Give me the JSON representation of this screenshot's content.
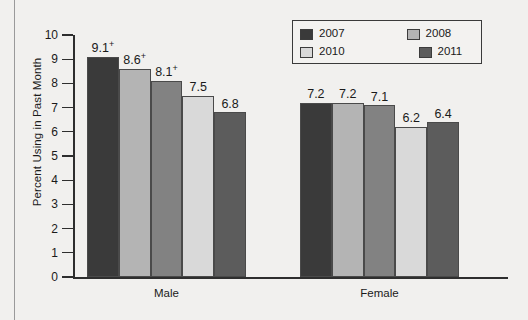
{
  "chart_data": {
    "type": "bar",
    "title": "",
    "xlabel": "",
    "ylabel": "Percent Using in Past Month",
    "ylim": [
      0,
      10
    ],
    "ytick_labels": [
      "0",
      "1",
      "2",
      "3",
      "4",
      "5",
      "6",
      "7",
      "8",
      "9",
      "10"
    ],
    "grid": false,
    "legend_position": "top-right",
    "categories": [
      "Male",
      "Female"
    ],
    "series": [
      {
        "name": "2007",
        "color": "#3a3a3a",
        "values": [
          9.1,
          7.2
        ],
        "labels": [
          "9.1",
          "7.2"
        ],
        "markers": [
          "+",
          ""
        ]
      },
      {
        "name": "2008",
        "color": "#b4b4b4",
        "values": [
          8.6,
          7.2
        ],
        "labels": [
          "8.6",
          "7.2"
        ],
        "markers": [
          "+",
          ""
        ]
      },
      {
        "name": "2009",
        "color": "#828282",
        "values": [
          8.1,
          7.1
        ],
        "labels": [
          "8.1",
          "7.1"
        ],
        "markers": [
          "+",
          ""
        ]
      },
      {
        "name": "2010",
        "color": "#d9d9d9",
        "values": [
          7.5,
          6.2
        ],
        "labels": [
          "7.5",
          "6.2"
        ],
        "markers": [
          "",
          ""
        ]
      },
      {
        "name": "2011",
        "color": "#5c5c5c",
        "values": [
          6.8,
          6.4
        ],
        "labels": [
          "6.8",
          "6.4"
        ],
        "markers": [
          "",
          ""
        ]
      }
    ],
    "annotation_note": "+ denotes difference between this estimate and the 2011 estimate is statistically significant"
  },
  "legend": {
    "rows": [
      [
        {
          "label": "2007",
          "color": "#3a3a3a"
        },
        {
          "label": "2008",
          "color": "#b4b4b4"
        },
        {
          "label": "2009",
          "color": "#828282"
        }
      ],
      [
        {
          "label": "2010",
          "color": "#d9d9d9"
        },
        {
          "label": "2011",
          "color": "#5c5c5c"
        }
      ]
    ]
  }
}
